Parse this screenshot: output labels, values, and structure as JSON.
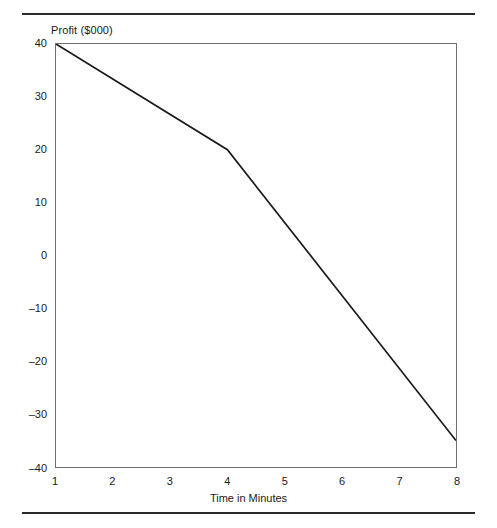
{
  "figure": {
    "has_top_rule": true,
    "has_bottom_rule": true,
    "rule_color": "#2b2b2b",
    "background_color": "#ffffff",
    "frame_color": "#6e6e6e"
  },
  "chart_data": {
    "type": "line",
    "title": "",
    "ylabel": "Profit ($000)",
    "xlabel": "Time in Minutes",
    "xlim": [
      1,
      8
    ],
    "ylim": [
      -40,
      40
    ],
    "grid": false,
    "legend": null,
    "x_ticks": [
      1,
      2,
      3,
      4,
      5,
      6,
      7,
      8
    ],
    "x_tick_labels": [
      "1",
      "2",
      "3",
      "4",
      "5",
      "6",
      "7",
      "8"
    ],
    "y_ticks": [
      40,
      30,
      20,
      10,
      0,
      -10,
      -20,
      -30,
      -40
    ],
    "y_tick_labels": [
      "40",
      "30",
      "20",
      "10",
      "0",
      "–10",
      "–20",
      "–30",
      "–40"
    ],
    "series": [
      {
        "name": "Profit",
        "color": "#1a1a1a",
        "line_width": 1.7,
        "x": [
          1,
          4,
          8
        ],
        "y": [
          40,
          20,
          -35
        ]
      }
    ],
    "annotations": []
  }
}
